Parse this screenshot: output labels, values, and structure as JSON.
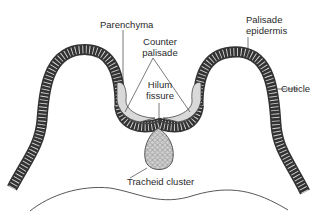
{
  "diagram": {
    "type": "botanical-cross-section",
    "colors": {
      "background": "#ffffff",
      "outline": "#333333",
      "cell_fill": "#d6d6d6",
      "cuticle": "#3a3a3a",
      "parenchyma_fill": "#d9d9d9",
      "leader_line": "#444444"
    },
    "labels": {
      "parenchyma": "Parenchyma",
      "counter_palisade_line1": "Counter",
      "counter_palisade_line2": "palisade",
      "hilum_line1": "Hilum",
      "hilum_line2": "fissure",
      "palisade_line1": "Palisade",
      "palisade_line2": "epidermis",
      "cuticle": "Cuticle",
      "tracheid": "Tracheid cluster"
    }
  }
}
